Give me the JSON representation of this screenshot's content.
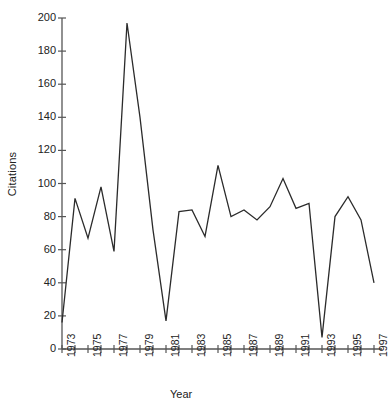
{
  "chart_data": {
    "type": "line",
    "title": "",
    "xlabel": "Year",
    "ylabel": "Citations",
    "xlim": [
      1972.5,
      1998
    ],
    "ylim": [
      0,
      200
    ],
    "grid": false,
    "legend": null,
    "y_ticks": [
      0,
      20,
      40,
      60,
      80,
      100,
      120,
      140,
      160,
      180,
      200
    ],
    "x_ticks_labeled": [
      "1973",
      "1975",
      "1977",
      "1979",
      "1981",
      "1983",
      "1985",
      "1987",
      "1989",
      "1991",
      "1993",
      "1995",
      "1997"
    ],
    "x_ticks_all": [
      1973,
      1974,
      1975,
      1976,
      1977,
      1978,
      1979,
      1980,
      1981,
      1982,
      1983,
      1984,
      1985,
      1986,
      1987,
      1988,
      1989,
      1990,
      1991,
      1992,
      1993,
      1994,
      1995,
      1996,
      1997
    ],
    "line_color": "#2b2b2b",
    "axis_color": "#555555",
    "x": [
      1973,
      1974,
      1975,
      1976,
      1977,
      1978,
      1979,
      1980,
      1981,
      1982,
      1983,
      1984,
      1985,
      1986,
      1987,
      1988,
      1989,
      1990,
      1991,
      1992,
      1993,
      1994,
      1995,
      1996,
      1997
    ],
    "values": [
      16,
      91,
      67,
      98,
      59,
      197,
      140,
      72,
      17,
      83,
      84,
      68,
      111,
      80,
      84,
      78,
      86,
      103,
      85,
      88,
      7,
      80,
      92,
      78,
      40
    ],
    "series": [
      {
        "name": "Citations",
        "values": [
          16,
          91,
          67,
          98,
          59,
          197,
          140,
          72,
          17,
          83,
          84,
          68,
          111,
          80,
          84,
          78,
          86,
          103,
          85,
          88,
          7,
          80,
          92,
          78,
          40
        ]
      }
    ]
  },
  "axes": {
    "y_title": "Citations",
    "x_title": "Year"
  }
}
